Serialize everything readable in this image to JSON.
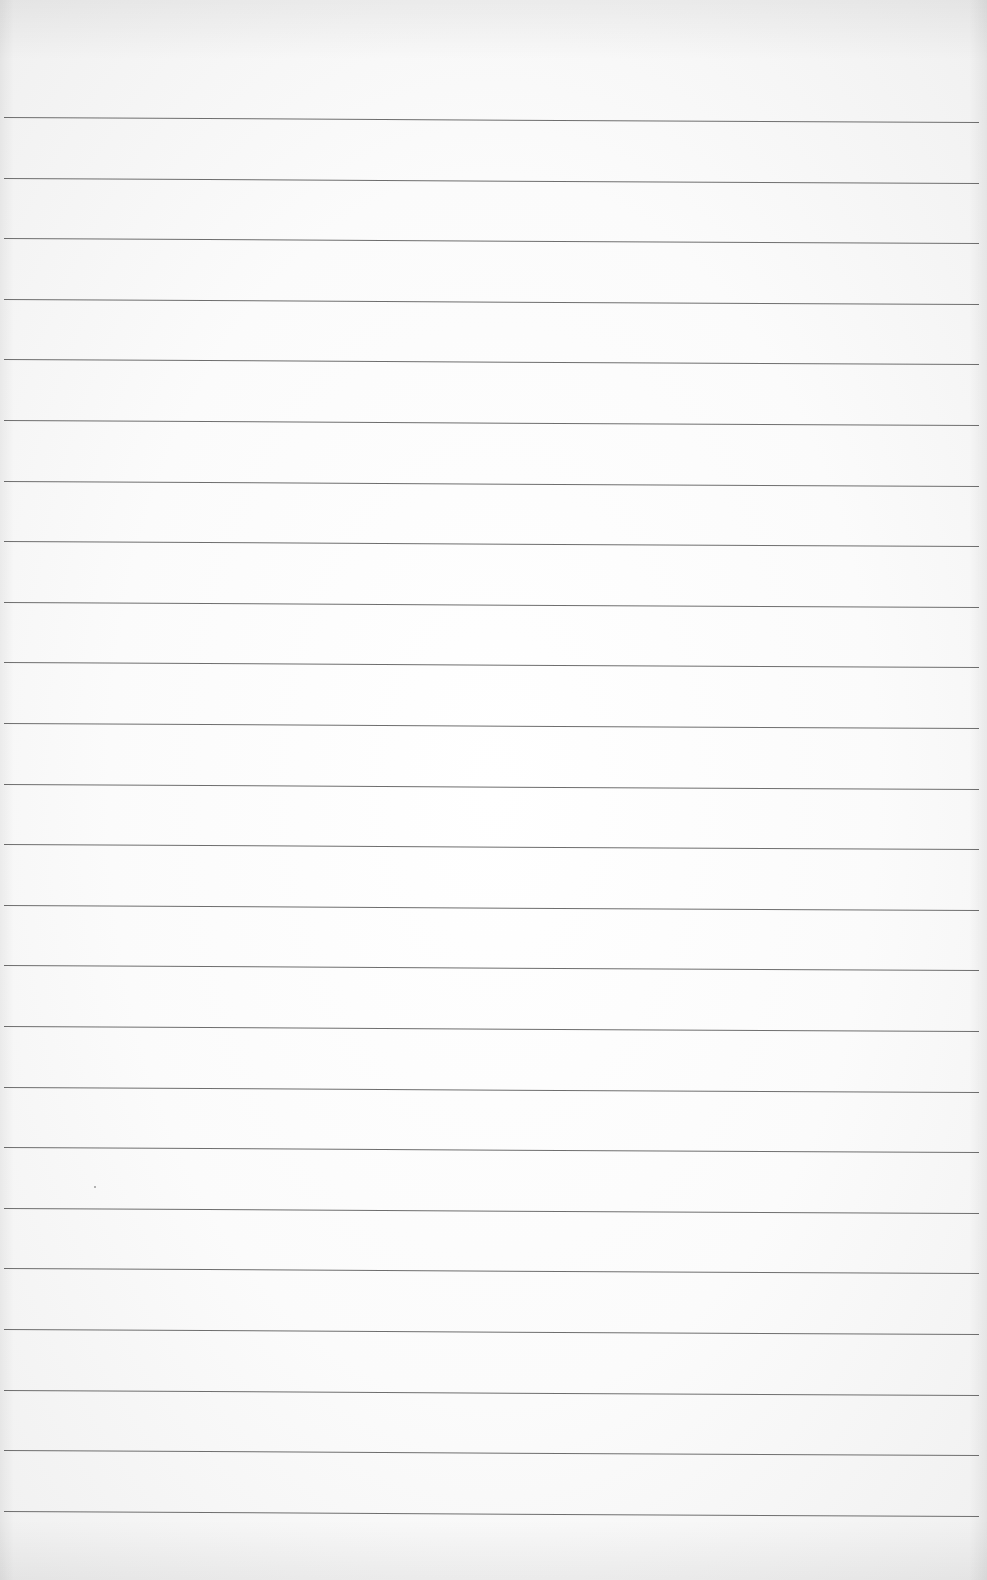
{
  "page": {
    "type": "lined-paper",
    "background_color": "#ffffff",
    "line_color": "#6e6e6e",
    "line_count": 24,
    "first_line_y": 117,
    "line_spacing": 60.6,
    "line_slope_deg": 0.3,
    "text_content": ""
  }
}
